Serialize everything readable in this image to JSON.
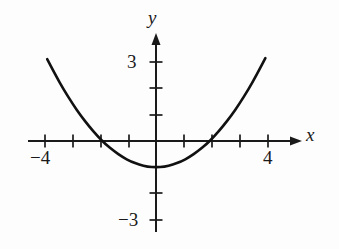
{
  "figure": {
    "title": "",
    "background_color": "#fdfdfd",
    "ink_color": "#1a1a1a"
  },
  "axes": {
    "x_axis_label": "x",
    "y_axis_label": "y",
    "x_tick_labels": [
      {
        "text": "−4",
        "value": -4
      },
      {
        "text": "4",
        "value": 4
      }
    ],
    "y_tick_labels": [
      {
        "text": "3",
        "value": 3
      },
      {
        "text": "−3",
        "value": -3
      }
    ]
  },
  "chart_data": {
    "type": "line",
    "title": "",
    "xlabel": "x",
    "ylabel": "y",
    "xlim": [
      -4.6,
      5.05
    ],
    "ylim": [
      -4.0,
      4.0
    ],
    "grid": false,
    "legend": null,
    "axis_arrows": {
      "x": "right",
      "y": "up"
    },
    "x_ticks": [
      -4,
      -3,
      -2,
      -1,
      0,
      1,
      2,
      3,
      4
    ],
    "x_ticks_labeled": [
      -4,
      4
    ],
    "y_ticks": [
      -3,
      -2,
      -1,
      0,
      1,
      2,
      3
    ],
    "y_ticks_labeled": [
      -3,
      3
    ],
    "series": [
      {
        "name": "parabola",
        "equation": "y = 0.27x^2 - 1",
        "vertex": [
          0,
          -1
        ],
        "roots": [
          -2,
          2
        ],
        "domain": [
          -3.9,
          3.92
        ],
        "x": [
          -3.9,
          -3.6,
          -3.3,
          -3.0,
          -2.7,
          -2.4,
          -2.1,
          -1.8,
          -1.5,
          -1.2,
          -0.9,
          -0.6,
          -0.3,
          0.0,
          0.3,
          0.6,
          0.9,
          1.2,
          1.5,
          1.8,
          2.1,
          2.4,
          2.7,
          3.0,
          3.3,
          3.6,
          3.92
        ],
        "y": [
          3.11,
          2.5,
          1.94,
          1.43,
          0.97,
          0.56,
          0.19,
          -0.13,
          -0.39,
          -0.61,
          -0.78,
          -0.9,
          -0.98,
          -1.0,
          -0.98,
          -0.9,
          -0.78,
          -0.61,
          -0.39,
          -0.13,
          0.19,
          0.56,
          0.97,
          1.43,
          1.94,
          2.5,
          3.15
        ]
      }
    ]
  }
}
